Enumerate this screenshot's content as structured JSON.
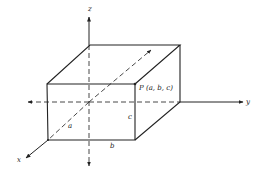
{
  "figure": {
    "type": "3D rectangular box in coordinate axes",
    "axes": {
      "x": "x",
      "y": "y",
      "z": "z"
    },
    "point": {
      "label": "P (a, b, c)"
    },
    "dimensions": {
      "a": "a",
      "b": "b",
      "c": "c"
    },
    "colors": {
      "stroke": "#222222",
      "background": "#ffffff"
    }
  }
}
